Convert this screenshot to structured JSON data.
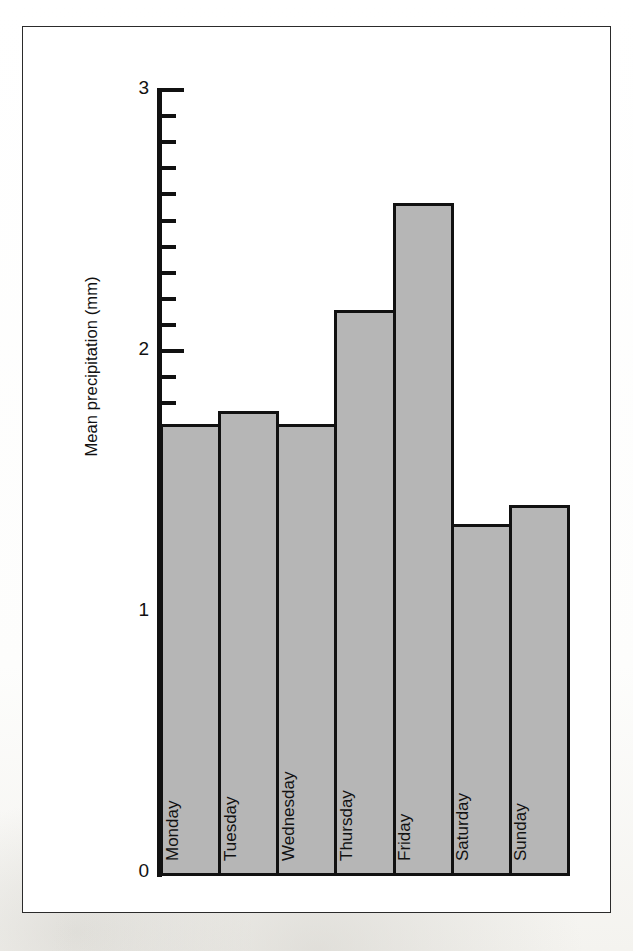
{
  "chart_data": {
    "type": "bar",
    "title": "",
    "subtitle": "",
    "xlabel": "",
    "ylabel": "Mean precipitation (mm)",
    "categories": [
      "Monday",
      "Tuesday",
      "Wednesday",
      "Thursday",
      "Friday",
      "Saturday",
      "Sunday"
    ],
    "values": [
      1.73,
      1.78,
      1.73,
      2.17,
      2.58,
      1.35,
      1.42
    ],
    "ylim": [
      0,
      3
    ],
    "y_major_ticks": [
      0,
      1,
      2,
      3
    ],
    "y_major_tick_labels": [
      "0",
      "1",
      "2",
      "3"
    ],
    "y_minor_tick_step": 0.1,
    "grid": false,
    "legend": false,
    "bar_fill_color": "#b6b6b6",
    "bar_edge_color": "#111111",
    "axis_color": "#111111",
    "frame_color": "#2b2b2b",
    "background_color": "#ffffff",
    "label_orientation": "vertical-inside-bar"
  },
  "axis": {
    "y_title": "Mean precipitation (mm)",
    "tick_labels": {
      "t0": "0",
      "t1": "1",
      "t2": "2",
      "t3": "3"
    }
  },
  "bars": [
    {
      "label": "Monday",
      "value": 1.73
    },
    {
      "label": "Tuesday",
      "value": 1.78
    },
    {
      "label": "Wednesday",
      "value": 1.73
    },
    {
      "label": "Thursday",
      "value": 2.17
    },
    {
      "label": "Friday",
      "value": 2.58
    },
    {
      "label": "Saturday",
      "value": 1.35
    },
    {
      "label": "Sunday",
      "value": 1.42
    }
  ]
}
